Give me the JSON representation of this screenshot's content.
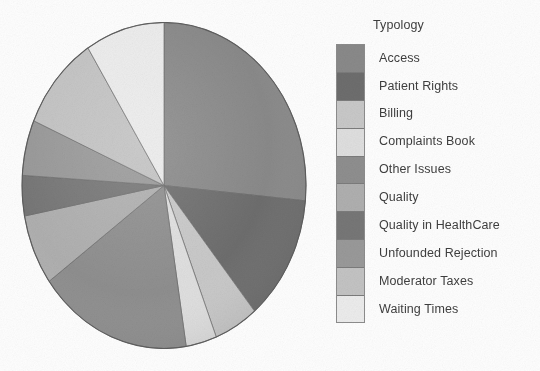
{
  "figure": {
    "background_color": "#ffffff",
    "text_color": "#3f3f3f"
  },
  "legend": {
    "title": "Typology",
    "swatch_border_color": "#8d8d8d",
    "items": [
      {
        "label": "Access",
        "color": "#8a8a8a"
      },
      {
        "label": "Patient Rights",
        "color": "#6e6e6e"
      },
      {
        "label": "Billing",
        "color": "#c9c9c9"
      },
      {
        "label": "Complaints Book",
        "color": "#e0e0e0"
      },
      {
        "label": "Other Issues",
        "color": "#8f8f8f"
      },
      {
        "label": "Quality",
        "color": "#b0b0b0"
      },
      {
        "label": "Quality in HealthCare",
        "color": "#777777"
      },
      {
        "label": "Unfounded Rejection",
        "color": "#9a9a9a"
      },
      {
        "label": "Moderator Taxes",
        "color": "#c4c4c4"
      },
      {
        "label": "Waiting Times",
        "color": "#ededed"
      }
    ]
  },
  "chart_data": {
    "type": "pie",
    "title": "",
    "legend_title": "Typology",
    "legend_position": "right",
    "grid": false,
    "start_angle_deg": -90,
    "direction": "clockwise",
    "center": {
      "x": 143,
      "y": 163.5
    },
    "radius": {
      "rx": 142,
      "ry": 163
    },
    "categories": [
      "Access",
      "Patient Rights",
      "Billing",
      "Complaints Book",
      "Other Issues",
      "Quality",
      "Quality in HealthCare",
      "Unfounded Rejection",
      "Moderator Taxes",
      "Waiting Times"
    ],
    "values": [
      26.5,
      12.5,
      5.0,
      3.5,
      17.5,
      7.0,
      4.0,
      5.5,
      9.5,
      9.0
    ],
    "unit": "percent",
    "colors": [
      "#8a8a8a",
      "#6e6e6e",
      "#c9c9c9",
      "#e0e0e0",
      "#8f8f8f",
      "#b0b0b0",
      "#777777",
      "#9a9a9a",
      "#c4c4c4",
      "#ededed"
    ]
  }
}
